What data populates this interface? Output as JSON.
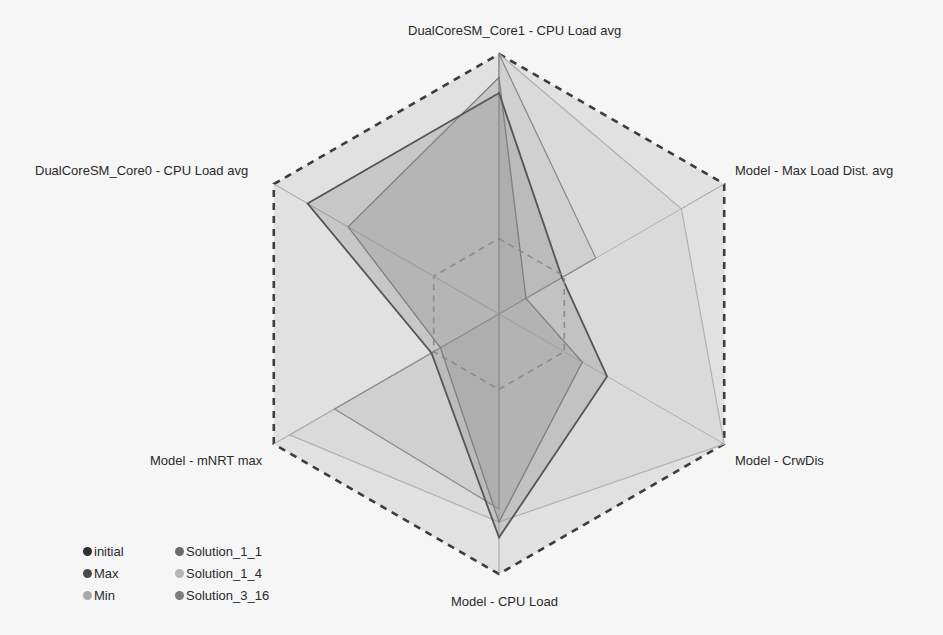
{
  "chart_data": {
    "type": "radar",
    "title": "",
    "axes": [
      "DualCoreSM_Core1 - CPU Load avg",
      "Model - Max Load Dist. avg",
      "Model - CrwDis",
      "Model - CPU Load",
      "Model - mNRT max",
      "DualCoreSM_Core0 - CPU Load avg"
    ],
    "range": [
      0,
      1
    ],
    "grid": false,
    "legend_position": "bottom-left",
    "series": [
      {
        "name": "initial",
        "color": "#3a3a3a",
        "values": [
          1.0,
          0.43,
          0.0,
          0.75,
          0.73,
          0.0
        ]
      },
      {
        "name": "Max",
        "color": "#4a4a4a",
        "values": [
          1.0,
          1.0,
          1.0,
          1.0,
          1.0,
          1.0
        ],
        "style": "dashed"
      },
      {
        "name": "Min",
        "color": "#a8a8a8",
        "values": [
          0.29,
          0.29,
          0.29,
          0.29,
          0.29,
          0.29
        ],
        "style": "dashed"
      },
      {
        "name": "Solution_1_1",
        "color": "#6a6a6a",
        "values": [
          0.85,
          0.28,
          0.48,
          0.86,
          0.3,
          0.85
        ]
      },
      {
        "name": "Solution_1_4",
        "color": "#b5b5b5",
        "values": [
          1.0,
          0.81,
          1.0,
          0.8,
          0.93,
          0.0
        ]
      },
      {
        "name": "Solution_3_16",
        "color": "#7d7d7d",
        "values": [
          0.91,
          0.12,
          0.37,
          0.8,
          0.26,
          0.67
        ]
      }
    ]
  },
  "labels": {
    "axis0": "DualCoreSM_Core1 - CPU Load avg",
    "axis1": "Model - Max Load Dist. avg",
    "axis2": "Model - CrwDis",
    "axis3": "Model - CPU Load",
    "axis4": "Model - mNRT max",
    "axis5": "DualCoreSM_Core0 - CPU Load avg"
  },
  "legend": [
    {
      "label": "initial",
      "color": "#2f2f2f"
    },
    {
      "label": "Solution_1_1",
      "color": "#6a6a6a"
    },
    {
      "label": "Max",
      "color": "#4a4a4a"
    },
    {
      "label": "Solution_1_4",
      "color": "#b5b5b5"
    },
    {
      "label": "Min",
      "color": "#a8a8a8"
    },
    {
      "label": "Solution_3_16",
      "color": "#7d7d7d"
    }
  ]
}
